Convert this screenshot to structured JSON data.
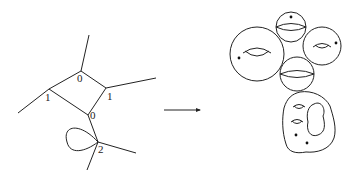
{
  "diagram": {
    "title": "",
    "graph": {
      "vertices": [
        {
          "id": "top",
          "label": "0",
          "x": 81,
          "y": 71
        },
        {
          "id": "left",
          "label": "1",
          "x": 49,
          "y": 89
        },
        {
          "id": "right",
          "label": "1",
          "x": 106,
          "y": 88
        },
        {
          "id": "bottom",
          "label": "0",
          "x": 88,
          "y": 115
        },
        {
          "id": "loop",
          "label": "2",
          "x": 98,
          "y": 142
        }
      ],
      "edges": [
        [
          "top",
          "left"
        ],
        [
          "top",
          "right"
        ],
        [
          "left",
          "bottom"
        ],
        [
          "right",
          "bottom"
        ],
        [
          "bottom",
          "loop"
        ]
      ],
      "legs": 5,
      "loops": 1
    },
    "arrow": {
      "direction": "right"
    },
    "surface": {
      "components": [
        {
          "type": "sphere",
          "genus": 0,
          "marked_points": 1
        },
        {
          "type": "torus",
          "genus": 1,
          "marked_points": 1
        },
        {
          "type": "torus",
          "genus": 1,
          "marked_points": 1
        },
        {
          "type": "sphere",
          "genus": 0,
          "marked_points": 0
        },
        {
          "type": "blob",
          "genus": 2,
          "marked_points": 2,
          "holes": 1
        }
      ]
    }
  }
}
